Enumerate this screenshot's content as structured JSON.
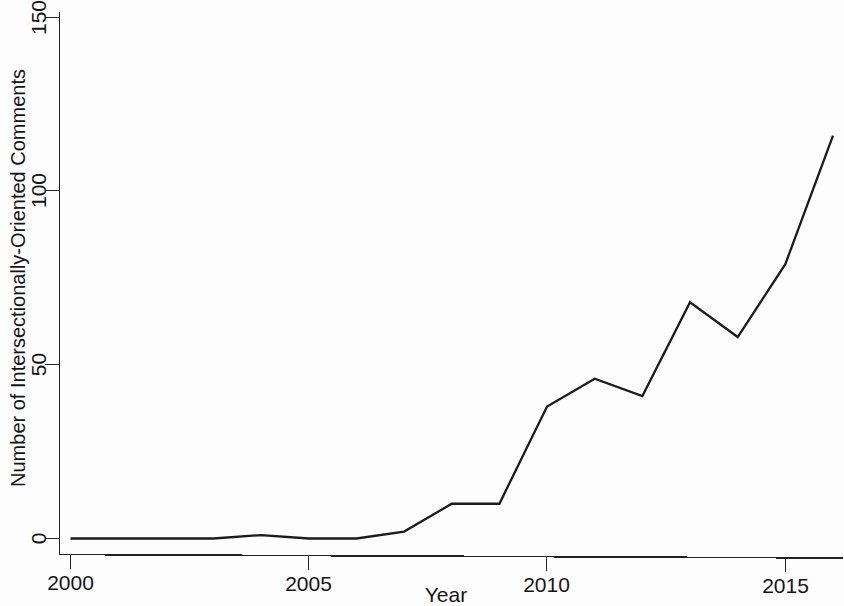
{
  "chart_data": {
    "type": "line",
    "title": "",
    "xlabel": "Year",
    "ylabel": "Number of Intersectionally-Oriented Comments",
    "x": [
      2000,
      2001,
      2002,
      2003,
      2004,
      2005,
      2006,
      2007,
      2008,
      2009,
      2010,
      2011,
      2012,
      2013,
      2014,
      2015,
      2016
    ],
    "values": [
      0,
      0,
      0,
      0,
      1,
      0,
      0,
      2,
      10,
      10,
      38,
      46,
      41,
      68,
      58,
      79,
      116
    ],
    "series": [
      {
        "name": "Intersectionally-Oriented Comments",
        "values": [
          0,
          0,
          0,
          0,
          1,
          0,
          0,
          2,
          10,
          10,
          38,
          46,
          41,
          68,
          58,
          79,
          116
        ]
      }
    ],
    "xlim": [
      2000,
      2016
    ],
    "ylim": [
      0,
      150
    ],
    "xticks": [
      2000,
      2005,
      2010,
      2015
    ],
    "xtick_labels": [
      "2000",
      "2005",
      "2010",
      "2015"
    ],
    "yticks": [
      0,
      50,
      100,
      150
    ],
    "ytick_labels": [
      "0",
      "50",
      "100",
      "150"
    ],
    "grid": false,
    "legend": false,
    "legend_position": "none",
    "line_color": "#1b1b1b",
    "axis_color": "#222222",
    "background_color": "#fdfdfd"
  },
  "axes": {
    "x_title": "Year",
    "y_title": "Number of Intersectionally-Oriented Comments"
  },
  "xticks": {
    "t0": "2000",
    "t1": "2005",
    "t2": "2010",
    "t3": "2015"
  },
  "yticks": {
    "t0": "0",
    "t1": "50",
    "t2": "100",
    "t3": "150"
  }
}
